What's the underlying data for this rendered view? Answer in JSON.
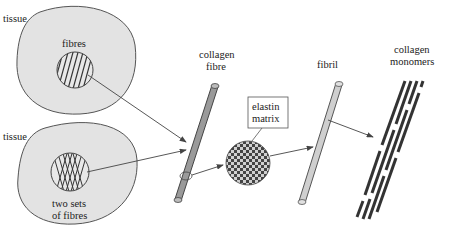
{
  "diagram": {
    "labels": {
      "tissue_top": "tissue",
      "fibres": "fibres",
      "tissue_bottom": "tissue",
      "two_sets_line1": "two sets",
      "two_sets_line2": "of fibres",
      "collagen_fibre_line1": "collagen",
      "collagen_fibre_line2": "fibre",
      "elastin_line1": "elastin",
      "elastin_line2": "matrix",
      "fibril": "fibril",
      "monomers_line1": "collagen",
      "monomers_line2": "monomers"
    },
    "colors": {
      "tissue_fill": "#e3e3e3",
      "outline": "#555555",
      "fibre_fill": "#9a9a9a",
      "fibril_fill": "#cfcfcf",
      "monomer": "#333333"
    }
  }
}
